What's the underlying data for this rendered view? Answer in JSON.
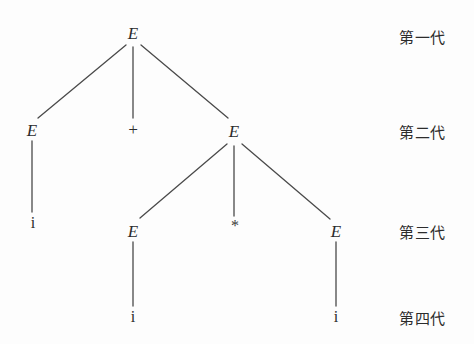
{
  "diagram": {
    "background_color": "#fdfdfd",
    "line_color": "#4a4a4a",
    "text_color": "#2b2b2b",
    "nodes": [
      {
        "id": "n1",
        "label": "E",
        "kind": "nonterminal",
        "x": 133,
        "y": 33,
        "level": 1
      },
      {
        "id": "n2",
        "label": "E",
        "kind": "nonterminal",
        "x": 32,
        "y": 130,
        "level": 2
      },
      {
        "id": "n3",
        "label": "+",
        "kind": "operator",
        "x": 133,
        "y": 129,
        "level": 2
      },
      {
        "id": "n4",
        "label": "E",
        "kind": "nonterminal",
        "x": 234,
        "y": 131,
        "level": 2
      },
      {
        "id": "n5",
        "label": "i",
        "kind": "terminal",
        "x": 33,
        "y": 223,
        "level": 3
      },
      {
        "id": "n6",
        "label": "E",
        "kind": "nonterminal",
        "x": 133,
        "y": 231,
        "level": 3
      },
      {
        "id": "n7",
        "label": "*",
        "kind": "operator",
        "x": 235,
        "y": 226,
        "level": 3
      },
      {
        "id": "n8",
        "label": "E",
        "kind": "nonterminal",
        "x": 336,
        "y": 231,
        "level": 3
      },
      {
        "id": "n9",
        "label": "i",
        "kind": "terminal",
        "x": 133,
        "y": 317,
        "level": 4
      },
      {
        "id": "n10",
        "label": "i",
        "kind": "terminal",
        "x": 336,
        "y": 317,
        "level": 4
      }
    ],
    "edges": [
      {
        "from": "n1",
        "to": "n2",
        "x1": 126,
        "y1": 45,
        "x2": 38,
        "y2": 118
      },
      {
        "from": "n1",
        "to": "n3",
        "x1": 133,
        "y1": 47,
        "x2": 133,
        "y2": 118
      },
      {
        "from": "n1",
        "to": "n4",
        "x1": 141,
        "y1": 45,
        "x2": 228,
        "y2": 118
      },
      {
        "from": "n2",
        "to": "n5",
        "x1": 32,
        "y1": 141,
        "x2": 32,
        "y2": 212
      },
      {
        "from": "n4",
        "to": "n6",
        "x1": 227,
        "y1": 144,
        "x2": 140,
        "y2": 218
      },
      {
        "from": "n4",
        "to": "n7",
        "x1": 234,
        "y1": 146,
        "x2": 234,
        "y2": 216
      },
      {
        "from": "n4",
        "to": "n8",
        "x1": 242,
        "y1": 144,
        "x2": 330,
        "y2": 219
      },
      {
        "from": "n6",
        "to": "n9",
        "x1": 133,
        "y1": 242,
        "x2": 133,
        "y2": 306
      },
      {
        "from": "n8",
        "to": "n10",
        "x1": 336,
        "y1": 242,
        "x2": 336,
        "y2": 306
      }
    ],
    "generation_labels": [
      {
        "text": "第一代",
        "x": 399,
        "y": 36
      },
      {
        "text": "第二代",
        "x": 399,
        "y": 131
      },
      {
        "text": "第三代",
        "x": 399,
        "y": 231
      },
      {
        "text": "第四代",
        "x": 399,
        "y": 317
      }
    ]
  }
}
